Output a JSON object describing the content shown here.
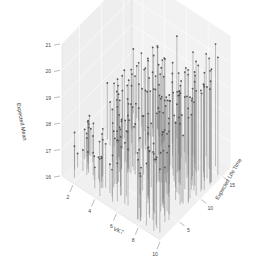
{
  "chart_data": {
    "type": "scatter",
    "subtype": "3d-scatter-with-droplines",
    "title": "",
    "xlabel": "VK7",
    "ylabel": "Expected Life Time",
    "zlabel": "Expected Mean",
    "xlim": [
      1,
      10
    ],
    "ylim": [
      1,
      17
    ],
    "zlim": [
      16,
      21
    ],
    "x_ticks": [
      "2",
      "4",
      "6",
      "8",
      "10"
    ],
    "y_ticks": [
      "5",
      "10",
      "15"
    ],
    "z_ticks": [
      "16",
      "17",
      "18",
      "19",
      "20",
      "21"
    ],
    "grid": true,
    "legend": null,
    "point_color": "#555555",
    "dropline_color": "#777777",
    "panel_color": "#eeeeee",
    "grid_color": "#ffffff",
    "n_points_approx": 220,
    "note": "Approximately 220 points; z increases with x and y (range ~16.5 to ~20.8). Points generated deterministically to match the visible spread."
  },
  "colors": {
    "background": "#ffffff",
    "panel": "#eeeeee",
    "edge": "#dddddd",
    "text": "#444444"
  }
}
